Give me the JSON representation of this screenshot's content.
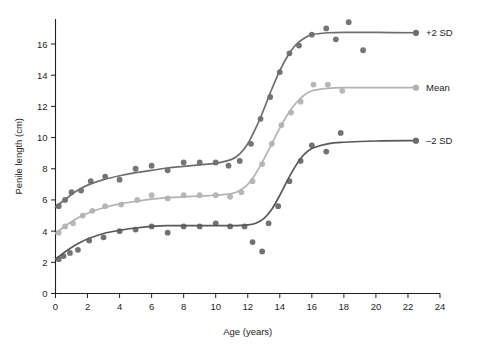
{
  "chart_data": {
    "type": "line",
    "title": "",
    "xlabel": "Age (years)",
    "ylabel": "Penile length (cm)",
    "xlim": [
      0,
      24
    ],
    "ylim": [
      0,
      17.6
    ],
    "xticks": [
      0,
      2,
      4,
      6,
      8,
      10,
      12,
      14,
      16,
      18,
      20,
      22,
      24
    ],
    "yticks": [
      0,
      2,
      4,
      6,
      8,
      10,
      12,
      14,
      16
    ],
    "xtick_labels": [
      "0",
      "2",
      "4",
      "6",
      "8",
      "10",
      "12",
      "14",
      "16",
      "18",
      "20",
      "22",
      "24"
    ],
    "ytick_labels": [
      "0",
      "2",
      "4",
      "6",
      "8",
      "10",
      "12",
      "14",
      "16"
    ],
    "grid": false,
    "legend_position": "right-inline",
    "series": [
      {
        "name": "+2 SD",
        "label": "+2 SD",
        "color": "#6e6e6e",
        "marker_color": "#6e6e6e",
        "curve": [
          [
            0.0,
            5.55
          ],
          [
            0.5,
            5.95
          ],
          [
            1.0,
            6.35
          ],
          [
            1.5,
            6.68
          ],
          [
            2.0,
            6.95
          ],
          [
            3.0,
            7.3
          ],
          [
            4.0,
            7.55
          ],
          [
            5.0,
            7.75
          ],
          [
            6.0,
            7.9
          ],
          [
            7.0,
            8.05
          ],
          [
            8.0,
            8.15
          ],
          [
            9.0,
            8.25
          ],
          [
            10.0,
            8.35
          ],
          [
            11.0,
            8.6
          ],
          [
            11.5,
            8.95
          ],
          [
            12.0,
            9.6
          ],
          [
            12.5,
            10.6
          ],
          [
            13.0,
            11.8
          ],
          [
            13.5,
            13.1
          ],
          [
            14.0,
            14.3
          ],
          [
            14.5,
            15.25
          ],
          [
            15.0,
            15.95
          ],
          [
            15.5,
            16.35
          ],
          [
            16.0,
            16.6
          ],
          [
            17.0,
            16.72
          ],
          [
            18.0,
            16.75
          ],
          [
            20.0,
            16.74
          ],
          [
            22.5,
            16.72
          ]
        ],
        "points": [
          [
            0.2,
            5.6
          ],
          [
            0.6,
            6.0
          ],
          [
            1.0,
            6.5
          ],
          [
            1.6,
            6.6
          ],
          [
            2.2,
            7.2
          ],
          [
            3.1,
            7.5
          ],
          [
            4.0,
            7.3
          ],
          [
            5.0,
            8.0
          ],
          [
            6.0,
            8.2
          ],
          [
            7.0,
            7.9
          ],
          [
            8.0,
            8.4
          ],
          [
            9.0,
            8.4
          ],
          [
            10.0,
            8.4
          ],
          [
            10.8,
            8.2
          ],
          [
            11.5,
            8.5
          ],
          [
            12.2,
            9.6
          ],
          [
            12.8,
            11.2
          ],
          [
            13.4,
            12.6
          ],
          [
            14.0,
            14.2
          ],
          [
            14.6,
            15.4
          ],
          [
            15.2,
            15.9
          ],
          [
            16.0,
            16.6
          ],
          [
            16.9,
            17.0
          ],
          [
            17.5,
            16.3
          ],
          [
            18.3,
            17.4
          ],
          [
            19.2,
            15.6
          ],
          [
            22.5,
            16.7
          ]
        ]
      },
      {
        "name": "Mean",
        "label": "Mean",
        "color": "#b3b3b3",
        "marker_color": "#b3b3b3",
        "curve": [
          [
            0.0,
            3.85
          ],
          [
            0.5,
            4.25
          ],
          [
            1.0,
            4.6
          ],
          [
            1.5,
            4.9
          ],
          [
            2.0,
            5.15
          ],
          [
            3.0,
            5.5
          ],
          [
            4.0,
            5.75
          ],
          [
            5.0,
            5.9
          ],
          [
            6.0,
            6.05
          ],
          [
            7.0,
            6.15
          ],
          [
            8.0,
            6.2
          ],
          [
            9.0,
            6.25
          ],
          [
            10.0,
            6.3
          ],
          [
            11.0,
            6.4
          ],
          [
            11.5,
            6.6
          ],
          [
            12.0,
            7.0
          ],
          [
            12.5,
            7.7
          ],
          [
            13.0,
            8.6
          ],
          [
            13.5,
            9.6
          ],
          [
            14.0,
            10.6
          ],
          [
            14.5,
            11.5
          ],
          [
            15.0,
            12.2
          ],
          [
            15.5,
            12.7
          ],
          [
            16.0,
            13.0
          ],
          [
            17.0,
            13.15
          ],
          [
            18.0,
            13.2
          ],
          [
            20.0,
            13.2
          ],
          [
            22.5,
            13.2
          ]
        ],
        "points": [
          [
            0.2,
            3.9
          ],
          [
            0.6,
            4.3
          ],
          [
            1.1,
            4.5
          ],
          [
            1.7,
            5.0
          ],
          [
            2.3,
            5.3
          ],
          [
            3.1,
            5.6
          ],
          [
            4.1,
            5.7
          ],
          [
            5.1,
            6.0
          ],
          [
            6.0,
            6.3
          ],
          [
            7.0,
            6.1
          ],
          [
            8.0,
            6.3
          ],
          [
            9.0,
            6.3
          ],
          [
            10.0,
            6.3
          ],
          [
            10.9,
            6.2
          ],
          [
            11.6,
            6.5
          ],
          [
            12.3,
            7.2
          ],
          [
            12.9,
            8.3
          ],
          [
            13.5,
            9.6
          ],
          [
            14.1,
            10.8
          ],
          [
            14.7,
            11.6
          ],
          [
            15.3,
            12.3
          ],
          [
            16.1,
            13.4
          ],
          [
            17.0,
            13.4
          ],
          [
            17.9,
            13.0
          ],
          [
            22.5,
            13.2
          ]
        ]
      },
      {
        "name": "-2 SD",
        "label": "–2 SD",
        "color": "#585858",
        "marker_color": "#6a6a6a",
        "curve": [
          [
            0.0,
            2.2
          ],
          [
            0.5,
            2.6
          ],
          [
            1.0,
            2.95
          ],
          [
            1.5,
            3.25
          ],
          [
            2.0,
            3.5
          ],
          [
            3.0,
            3.85
          ],
          [
            4.0,
            4.05
          ],
          [
            5.0,
            4.2
          ],
          [
            6.0,
            4.3
          ],
          [
            7.0,
            4.35
          ],
          [
            8.0,
            4.35
          ],
          [
            9.0,
            4.35
          ],
          [
            10.0,
            4.35
          ],
          [
            11.0,
            4.35
          ],
          [
            12.0,
            4.4
          ],
          [
            12.5,
            4.5
          ],
          [
            13.0,
            4.8
          ],
          [
            13.5,
            5.4
          ],
          [
            14.0,
            6.3
          ],
          [
            14.5,
            7.3
          ],
          [
            15.0,
            8.2
          ],
          [
            15.5,
            8.9
          ],
          [
            16.0,
            9.3
          ],
          [
            17.0,
            9.6
          ],
          [
            18.0,
            9.7
          ],
          [
            20.0,
            9.78
          ],
          [
            22.5,
            9.8
          ]
        ],
        "points": [
          [
            0.2,
            2.2
          ],
          [
            0.5,
            2.4
          ],
          [
            0.9,
            2.6
          ],
          [
            1.4,
            2.8
          ],
          [
            2.1,
            3.4
          ],
          [
            3.0,
            3.6
          ],
          [
            4.0,
            4.0
          ],
          [
            5.0,
            4.1
          ],
          [
            6.0,
            4.3
          ],
          [
            7.0,
            3.9
          ],
          [
            8.0,
            4.3
          ],
          [
            9.0,
            4.3
          ],
          [
            10.0,
            4.5
          ],
          [
            10.9,
            4.3
          ],
          [
            11.8,
            4.3
          ],
          [
            12.3,
            3.3
          ],
          [
            12.9,
            2.7
          ],
          [
            13.3,
            4.5
          ],
          [
            13.9,
            5.6
          ],
          [
            14.6,
            7.2
          ],
          [
            15.3,
            8.5
          ],
          [
            16.0,
            9.5
          ],
          [
            16.9,
            9.1
          ],
          [
            17.8,
            10.3
          ],
          [
            22.5,
            9.8
          ]
        ]
      }
    ]
  },
  "axes": {
    "x_title": "Age (years)",
    "y_title": "Penile length (cm)"
  }
}
